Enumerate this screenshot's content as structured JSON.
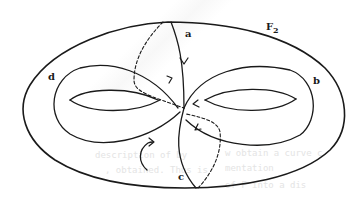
{
  "diagram": {
    "surface_label": "F",
    "surface_subscript": "2",
    "curve_labels": {
      "a": "a",
      "b": "b",
      "c": "c",
      "d": "d"
    },
    "colors": {
      "ink": "#1a1a1a",
      "background": "#ffffff"
    },
    "background_text": [
      "description of   by",
      ", obtained. Thus is",
      "w obtain a curve c",
      "mentation",
      "of F into a dis"
    ]
  }
}
